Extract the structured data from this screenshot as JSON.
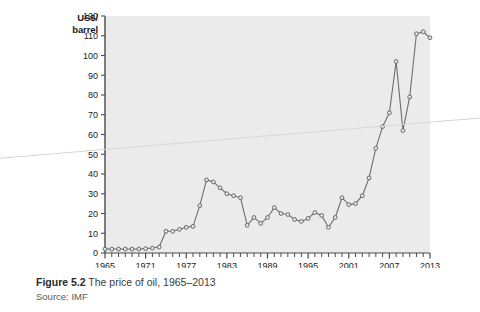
{
  "figure": {
    "caption_prefix": "Figure 5.2",
    "caption_text": " The price of oil, 1965–2013",
    "source": "Source: IMF"
  },
  "axis": {
    "y_title_line1": "US$/",
    "y_title_line2": "barrel"
  },
  "colors": {
    "plot_background": "#ebebeb",
    "line": "#6e6e6e",
    "marker_fill": "#e8e8e8",
    "marker_stroke": "#5a5a5a",
    "axis": "#4a4a4a",
    "page_background": "#ffffff",
    "caption_text": "#3c3c3c",
    "source_text": "#58585a"
  },
  "chart_data": {
    "type": "line",
    "xlabel": "",
    "ylabel": "US$/barrel",
    "xlim": [
      1965,
      2013
    ],
    "ylim": [
      0,
      120
    ],
    "yticks": [
      0,
      10,
      20,
      30,
      40,
      50,
      60,
      70,
      80,
      90,
      100,
      110,
      120
    ],
    "ytick_labels": [
      "0",
      "10",
      "20",
      "30",
      "40",
      "50",
      "60",
      "70",
      "80",
      "90",
      "100",
      "110",
      "120"
    ],
    "xticks_labeled": [
      1965,
      1971,
      1977,
      1983,
      1989,
      1995,
      2001,
      2007,
      2013
    ],
    "xtick_labels": [
      "1965",
      "1971",
      "1977",
      "1983",
      "1989",
      "1995",
      "2001",
      "2007",
      "2013"
    ],
    "xtick_interval_minor": 1,
    "grid": false,
    "legend": false,
    "markers": "open-circle",
    "x": [
      1965,
      1966,
      1967,
      1968,
      1969,
      1970,
      1971,
      1972,
      1973,
      1974,
      1975,
      1976,
      1977,
      1978,
      1979,
      1980,
      1981,
      1982,
      1983,
      1984,
      1985,
      1986,
      1987,
      1988,
      1989,
      1990,
      1991,
      1992,
      1993,
      1994,
      1995,
      1996,
      1997,
      1998,
      1999,
      2000,
      2001,
      2002,
      2003,
      2004,
      2005,
      2006,
      2007,
      2008,
      2009,
      2010,
      2011,
      2012,
      2013
    ],
    "values": [
      2.0,
      2.0,
      2.0,
      2.0,
      2.0,
      2.0,
      2.2,
      2.5,
      3.0,
      11.0,
      11.0,
      12.0,
      13.0,
      13.5,
      24.0,
      37.0,
      36.0,
      33.0,
      30.0,
      29.0,
      28.0,
      14.0,
      18.0,
      15.0,
      18.0,
      23.0,
      20.0,
      19.5,
      17.0,
      16.0,
      17.5,
      20.5,
      19.0,
      13.0,
      18.0,
      28.0,
      24.5,
      25.0,
      29.0,
      38.0,
      53.0,
      64.0,
      71.0,
      97.0,
      62.0,
      79.0,
      111.0,
      112.0,
      109.0
    ],
    "series_name": "Crude oil price"
  }
}
